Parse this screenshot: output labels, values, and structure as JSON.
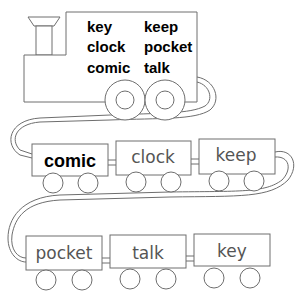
{
  "engine": {
    "word_bank": [
      [
        "key",
        "keep"
      ],
      [
        "clock",
        "pocket"
      ],
      [
        "comic",
        "talk"
      ]
    ]
  },
  "cars": [
    {
      "label": "comic",
      "bold": true
    },
    {
      "label": "clock",
      "bold": false
    },
    {
      "label": "keep",
      "bold": false
    },
    {
      "label": "pocket",
      "bold": false
    },
    {
      "label": "talk",
      "bold": false
    },
    {
      "label": "key",
      "bold": false
    }
  ],
  "colors": {
    "line": "#6e6e6e",
    "example_text": "#000000",
    "car_text": "#555555",
    "background": "#ffffff"
  }
}
